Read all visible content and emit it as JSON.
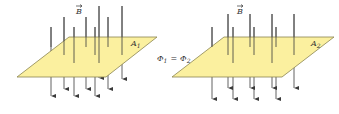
{
  "colors": {
    "plane_fill": "#fbf09f",
    "plane_stroke": "#8a8450",
    "field_line": "#3a3a3a",
    "text": "#333333"
  },
  "labels": {
    "field_symbol": "B",
    "left_area": "A",
    "left_area_sub": "1",
    "right_area": "A",
    "right_area_sub": "2",
    "flux_eq_phi1": "Φ",
    "flux_eq_sub1": "1",
    "flux_eq_equals": "=",
    "flux_eq_phi2": "Φ",
    "flux_eq_sub2": "2"
  },
  "diagrams": [
    {
      "name": "left",
      "plane": [
        [
          69,
          37
        ],
        [
          157,
          37
        ],
        [
          106,
          77
        ],
        [
          17,
          77
        ]
      ],
      "lines": [
        {
          "x": 51,
          "top": 27,
          "bottom": 101
        },
        {
          "x": 64,
          "top": 17,
          "bottom": 94
        },
        {
          "x": 74,
          "top": 27,
          "bottom": 101
        },
        {
          "x": 86,
          "top": 17,
          "bottom": 94
        },
        {
          "x": 95,
          "top": 27,
          "bottom": 101
        },
        {
          "x": 99,
          "top": 6,
          "bottom": 83
        },
        {
          "x": 108,
          "top": 17,
          "bottom": 94
        },
        {
          "x": 122,
          "top": 6,
          "bottom": 84
        }
      ]
    },
    {
      "name": "right",
      "plane": [
        [
          224,
          37
        ],
        [
          334,
          37
        ],
        [
          282,
          77
        ],
        [
          172,
          77
        ]
      ],
      "lines": [
        {
          "x": 212,
          "top": 27,
          "bottom": 104
        },
        {
          "x": 228,
          "top": 14,
          "bottom": 93
        },
        {
          "x": 233,
          "top": 27,
          "bottom": 104
        },
        {
          "x": 250,
          "top": 14,
          "bottom": 93
        },
        {
          "x": 254,
          "top": 27,
          "bottom": 104
        },
        {
          "x": 272,
          "top": 14,
          "bottom": 93
        },
        {
          "x": 276,
          "top": 27,
          "bottom": 104
        },
        {
          "x": 294,
          "top": 14,
          "bottom": 93
        }
      ]
    }
  ]
}
